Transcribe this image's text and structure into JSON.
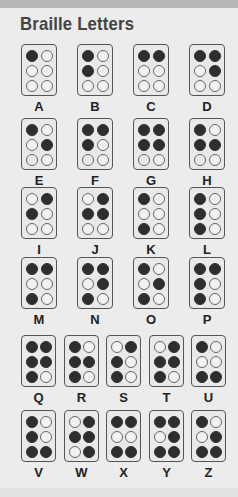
{
  "title": "Braille Letters",
  "colors": {
    "raised": "#2e2e2e",
    "flat": "#f2f2f2",
    "background": "#ececec"
  },
  "dot_order": "dots listed as [1,2,3,4,5,6]: 1-3 left column top-to-bottom, 4-6 right column top-to-bottom",
  "rows": [
    {
      "letters": [
        {
          "label": "A",
          "dots": [
            1,
            0,
            0,
            0,
            0,
            0
          ]
        },
        {
          "label": "B",
          "dots": [
            1,
            1,
            0,
            0,
            0,
            0
          ]
        },
        {
          "label": "C",
          "dots": [
            1,
            0,
            0,
            1,
            0,
            0
          ]
        },
        {
          "label": "D",
          "dots": [
            1,
            0,
            0,
            1,
            1,
            0
          ]
        }
      ]
    },
    {
      "letters": [
        {
          "label": "E",
          "dots": [
            1,
            0,
            0,
            0,
            1,
            0
          ]
        },
        {
          "label": "F",
          "dots": [
            1,
            1,
            0,
            1,
            0,
            0
          ]
        },
        {
          "label": "G",
          "dots": [
            1,
            1,
            0,
            1,
            1,
            0
          ]
        },
        {
          "label": "H",
          "dots": [
            1,
            1,
            0,
            0,
            1,
            0
          ]
        }
      ]
    },
    {
      "letters": [
        {
          "label": "I",
          "dots": [
            0,
            1,
            0,
            1,
            0,
            0
          ]
        },
        {
          "label": "J",
          "dots": [
            0,
            1,
            0,
            1,
            1,
            0
          ]
        },
        {
          "label": "K",
          "dots": [
            1,
            0,
            1,
            0,
            0,
            0
          ]
        },
        {
          "label": "L",
          "dots": [
            1,
            1,
            1,
            0,
            0,
            0
          ]
        }
      ]
    },
    {
      "letters": [
        {
          "label": "M",
          "dots": [
            1,
            0,
            1,
            1,
            0,
            0
          ]
        },
        {
          "label": "N",
          "dots": [
            1,
            0,
            1,
            1,
            1,
            0
          ]
        },
        {
          "label": "O",
          "dots": [
            1,
            0,
            1,
            0,
            1,
            0
          ]
        },
        {
          "label": "P",
          "dots": [
            1,
            1,
            1,
            1,
            0,
            0
          ]
        }
      ]
    },
    {
      "letters": [
        {
          "label": "Q",
          "dots": [
            1,
            1,
            1,
            1,
            1,
            0
          ]
        },
        {
          "label": "R",
          "dots": [
            1,
            1,
            1,
            0,
            1,
            0
          ]
        },
        {
          "label": "S",
          "dots": [
            0,
            1,
            1,
            1,
            0,
            0
          ]
        },
        {
          "label": "T",
          "dots": [
            0,
            1,
            1,
            1,
            1,
            0
          ]
        },
        {
          "label": "U",
          "dots": [
            1,
            0,
            1,
            0,
            0,
            1
          ]
        }
      ]
    },
    {
      "letters": [
        {
          "label": "V",
          "dots": [
            1,
            1,
            1,
            0,
            0,
            1
          ]
        },
        {
          "label": "W",
          "dots": [
            0,
            1,
            0,
            1,
            1,
            1
          ]
        },
        {
          "label": "X",
          "dots": [
            1,
            0,
            1,
            1,
            0,
            1
          ]
        },
        {
          "label": "Y",
          "dots": [
            1,
            0,
            1,
            1,
            1,
            1
          ]
        },
        {
          "label": "Z",
          "dots": [
            1,
            0,
            1,
            0,
            1,
            1
          ]
        }
      ]
    }
  ]
}
